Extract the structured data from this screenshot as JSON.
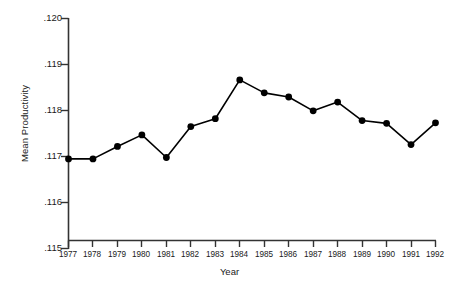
{
  "chart_data": {
    "type": "line",
    "title": "",
    "xlabel": "Year",
    "ylabel": "Mean Productivity",
    "categories": [
      "1977",
      "1978",
      "1979",
      "1980",
      "1981",
      "1982",
      "1983",
      "1984",
      "1985",
      "1986",
      "1987",
      "1988",
      "1989",
      "1990",
      "1991",
      "1992"
    ],
    "x": [
      1977,
      1978,
      1979,
      1980,
      1981,
      1982,
      1983,
      1984,
      1985,
      1986,
      1987,
      1988,
      1989,
      1990,
      1991,
      1992
    ],
    "values": [
      0.11695,
      0.11695,
      0.11722,
      0.11747,
      0.11698,
      0.11765,
      0.11782,
      0.11866,
      0.11838,
      0.11829,
      0.11799,
      0.11818,
      0.11778,
      0.11772,
      0.11726,
      0.11773
    ],
    "ylim": [
      0.115,
      0.12
    ],
    "xlim": [
      1977,
      1992
    ],
    "yticks": [
      0.115,
      0.116,
      0.117,
      0.118,
      0.119,
      0.12
    ],
    "ytick_labels": [
      ".115",
      ".116",
      ".117",
      ".118",
      ".119",
      ".120"
    ],
    "grid": false,
    "legend": null,
    "marker": "filled-circle",
    "line_color": "#000000",
    "marker_color": "#000000",
    "axis_color": "#333333"
  }
}
